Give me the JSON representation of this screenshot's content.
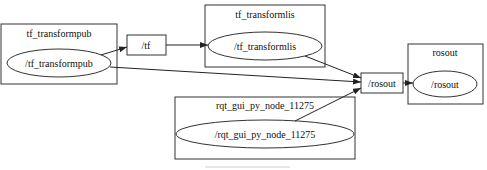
{
  "diagram": {
    "type": "rqt_graph",
    "nodes": [
      {
        "id": "tf_transformpub",
        "cluster_label": "tf_transformpub",
        "node_label": "/tf_transformpub"
      },
      {
        "id": "tf_transformlis",
        "cluster_label": "tf_transformlis",
        "node_label": "/tf_transformlis"
      },
      {
        "id": "rosout",
        "cluster_label": "rosout",
        "node_label": "/rosout"
      },
      {
        "id": "rqt_gui",
        "cluster_label": "rqt_gui_py_node_11275",
        "node_label": "/rqt_gui_py_node_11275"
      }
    ],
    "topics": [
      {
        "id": "tf",
        "label": "/tf"
      },
      {
        "id": "rosout_topic",
        "label": "/rosout"
      }
    ],
    "edges": [
      {
        "from": "/tf_transformpub",
        "to": "/tf"
      },
      {
        "from": "/tf",
        "to": "/tf_transformlis"
      },
      {
        "from": "/tf_transformpub",
        "to": "/rosout (topic)"
      },
      {
        "from": "/tf_transformlis",
        "to": "/rosout (topic)"
      },
      {
        "from": "/rqt_gui_py_node_11275",
        "to": "/rosout (topic)"
      },
      {
        "from": "/rosout (topic)",
        "to": "/rosout"
      }
    ],
    "colors": {
      "stroke": "#333333",
      "background": "#ffffff"
    }
  }
}
